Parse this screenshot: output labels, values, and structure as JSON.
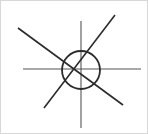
{
  "figure": {
    "title": "",
    "background_color": "#ffffff",
    "border_color": "#d8d8d8",
    "stroke_color": "#2b2b2b",
    "axis_color": "#555555",
    "canvas": {
      "width": 148,
      "height": 134
    }
  },
  "chart_data": {
    "type": "scatter",
    "title": "",
    "subtitle": "",
    "xlabel": "",
    "ylabel": "",
    "grid": false,
    "legend": [],
    "legend_position": "none",
    "xlim": [
      0,
      148
    ],
    "ylim": [
      0,
      134
    ],
    "annotations": [],
    "tick_labels": {
      "x": [],
      "y": []
    },
    "shapes": [
      {
        "name": "circle",
        "kind": "circle",
        "cx": 80,
        "cy": 69,
        "r": 19,
        "stroke": "#2b2b2b",
        "stroke_width": 1.8,
        "fill": "none"
      },
      {
        "name": "horizontal-axis-line",
        "kind": "line",
        "x1": 22,
        "y1": 68,
        "x2": 140,
        "y2": 68,
        "stroke": "#555555",
        "stroke_width": 1.1
      },
      {
        "name": "vertical-axis-line",
        "kind": "line",
        "x1": 80,
        "y1": 20,
        "x2": 80,
        "y2": 127,
        "stroke": "#555555",
        "stroke_width": 1.1
      },
      {
        "name": "diagonal-line-nw-se",
        "kind": "line",
        "x1": 17,
        "y1": 27,
        "x2": 122,
        "y2": 104,
        "stroke": "#2b2b2b",
        "stroke_width": 1.6
      },
      {
        "name": "diagonal-line-sw-ne",
        "kind": "line",
        "x1": 43,
        "y1": 107,
        "x2": 114,
        "y2": 14,
        "stroke": "#2b2b2b",
        "stroke_width": 1.6
      }
    ]
  }
}
